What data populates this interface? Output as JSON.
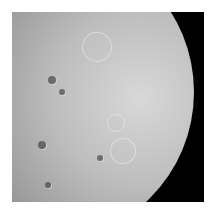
{
  "image": {
    "subject": "Cratered moon, gibbous phase, illuminated limb on right, terminator on left",
    "background_color": "#ffffff",
    "frame_color": "#000000",
    "surface_light": "#d8d8d8",
    "surface_mid": "#9a9a9a"
  },
  "craters": [
    {
      "x": 96,
      "y": 46,
      "r": 14,
      "tone": "light"
    },
    {
      "x": 122,
      "y": 150,
      "r": 12,
      "tone": "light"
    },
    {
      "x": 115,
      "y": 122,
      "r": 8,
      "tone": "light"
    },
    {
      "x": 52,
      "y": 80,
      "r": 4,
      "tone": "dark"
    },
    {
      "x": 42,
      "y": 145,
      "r": 4,
      "tone": "dark"
    },
    {
      "x": 100,
      "y": 158,
      "r": 3,
      "tone": "dark"
    },
    {
      "x": 62,
      "y": 92,
      "r": 3,
      "tone": "dark"
    },
    {
      "x": 48,
      "y": 185,
      "r": 3,
      "tone": "dark"
    }
  ]
}
